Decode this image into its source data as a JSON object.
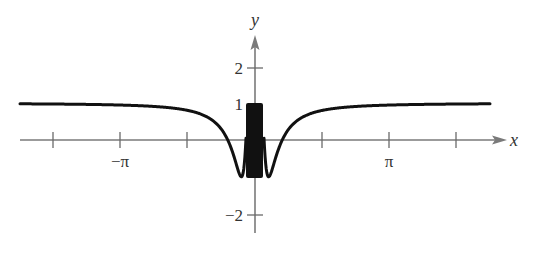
{
  "chart_data": {
    "type": "line",
    "title": "",
    "function": "y = cos(1/x)",
    "xlabel": "x",
    "ylabel": "y",
    "xlim": [
      -5.5,
      5.9
    ],
    "ylim": [
      -2.6,
      3.0
    ],
    "x_ticks": [
      {
        "value": -4.712,
        "label": ""
      },
      {
        "value": -3.1416,
        "label": "−π"
      },
      {
        "value": -1.5708,
        "label": ""
      },
      {
        "value": 1.5708,
        "label": ""
      },
      {
        "value": 3.1416,
        "label": "π"
      },
      {
        "value": 4.712,
        "label": ""
      }
    ],
    "y_ticks": [
      {
        "value": 2,
        "label": "2"
      },
      {
        "value": 1,
        "label": "1"
      },
      {
        "value": -2,
        "label": "−2"
      }
    ],
    "series": [
      {
        "name": "cos(1/x)",
        "x": [
          -5.46,
          -4.712,
          -3.1416,
          -2.0,
          -1.5708,
          -1.0,
          -0.8,
          -0.6366,
          -0.5,
          -0.4,
          -0.3183,
          -0.25,
          -0.2,
          0.2,
          0.25,
          0.3183,
          0.4,
          0.5,
          0.6366,
          0.8,
          1.0,
          1.5708,
          2.0,
          3.1416,
          4.712,
          5.53
        ],
        "values": [
          0.983,
          0.978,
          0.95,
          0.878,
          0.804,
          0.54,
          0.315,
          0.0,
          -0.416,
          -0.801,
          -1.0,
          -0.654,
          0.284,
          0.284,
          -0.654,
          -1.0,
          -0.801,
          -0.416,
          0.0,
          0.315,
          0.54,
          0.804,
          0.878,
          0.95,
          0.978,
          0.984
        ]
      }
    ],
    "annotations": [
      "Dense oscillation between −1 and 1 near x = 0 rendered as solid band"
    ],
    "grid": false,
    "legend": null
  },
  "axes": {
    "x_label": "x",
    "y_label": "y",
    "x_tick_labels": [
      "−π",
      "π"
    ],
    "y_tick_labels": [
      "2",
      "1",
      "−2"
    ]
  }
}
